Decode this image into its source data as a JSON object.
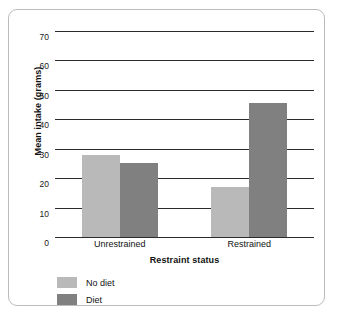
{
  "chart_data": {
    "type": "bar",
    "title": "",
    "xlabel": "Restraint status",
    "ylabel": "Mean intake (grams)",
    "categories": [
      "Unrestrained",
      "Restrained"
    ],
    "series": [
      {
        "name": "No diet",
        "color": "#b9b9b9",
        "values": [
          28,
          17
        ]
      },
      {
        "name": "Diet",
        "color": "#808080",
        "values": [
          25,
          45.5
        ]
      }
    ],
    "ylim": [
      0,
      70
    ],
    "yticks": [
      0,
      10,
      20,
      30,
      40,
      50,
      60,
      70
    ],
    "ytick_labels": [
      "0",
      "10",
      "20",
      "30",
      "40",
      "50",
      "60",
      "70"
    ],
    "grid": true,
    "grid_color": "#2b2b2b",
    "legend_position": "bottom-left",
    "frame_color": "#b9bcbe"
  }
}
